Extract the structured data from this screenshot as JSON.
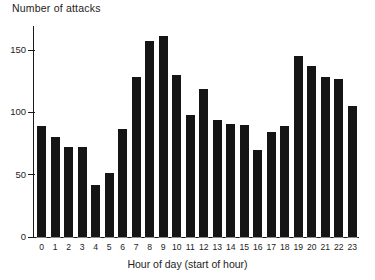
{
  "chart_data": {
    "type": "bar",
    "title": "Number of attacks",
    "ylabel": "Number of attacks",
    "xlabel": "Hour of day (start of hour)",
    "categories": [
      "0",
      "1",
      "2",
      "3",
      "4",
      "5",
      "6",
      "7",
      "8",
      "9",
      "10",
      "11",
      "12",
      "13",
      "14",
      "15",
      "16",
      "17",
      "18",
      "19",
      "20",
      "21",
      "22",
      "23"
    ],
    "values": [
      89,
      80,
      72,
      72,
      42,
      51,
      87,
      128,
      157,
      161,
      130,
      98,
      119,
      94,
      91,
      90,
      70,
      84,
      89,
      145,
      137,
      128,
      127,
      105
    ],
    "ylim": [
      0,
      170
    ],
    "yticks": [
      0,
      50,
      100,
      150
    ],
    "ytick_labels": [
      "0",
      "50",
      "100",
      "150"
    ],
    "grid": false,
    "legend": null,
    "bar_color": "#151515",
    "axis_color": "#1a1a1a",
    "background": "#ffffff"
  },
  "axis": {
    "y_title": "Number of attacks",
    "x_title": "Hour of day (start of hour)"
  }
}
